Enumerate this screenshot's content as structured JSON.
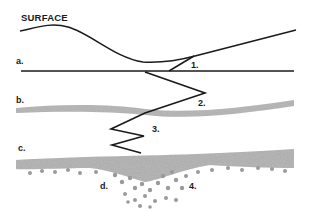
{
  "title": "SURFACE",
  "layers": [
    {
      "id": "a",
      "label": "a."
    },
    {
      "id": "b",
      "label": "b."
    },
    {
      "id": "c",
      "label": "c."
    },
    {
      "id": "d",
      "label": "d."
    }
  ],
  "markers": [
    {
      "id": "1",
      "label": "1."
    },
    {
      "id": "2",
      "label": "2."
    },
    {
      "id": "3",
      "label": "3."
    },
    {
      "id": "4",
      "label": "4."
    }
  ],
  "colors": {
    "line": "#1a1a1a",
    "band": "#9a9a9a",
    "background": "#ffffff"
  }
}
